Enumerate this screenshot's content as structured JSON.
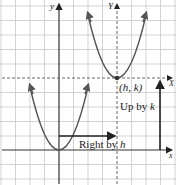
{
  "diagram": {
    "axes": {
      "original": {
        "x_label": "x",
        "y_label": "y"
      },
      "translated": {
        "x_label": "X",
        "y_label": "Y"
      }
    },
    "vertex_label": "(h, k)",
    "arrows": {
      "horizontal": {
        "prefix": "Right by ",
        "var": "h"
      },
      "vertical": {
        "prefix": "Up by ",
        "var": "k"
      }
    },
    "colors": {
      "grid": "#c8c8c8",
      "axis": "#333333",
      "curve": "#555555",
      "dashed": "#666666",
      "arrow": "#222222"
    }
  }
}
